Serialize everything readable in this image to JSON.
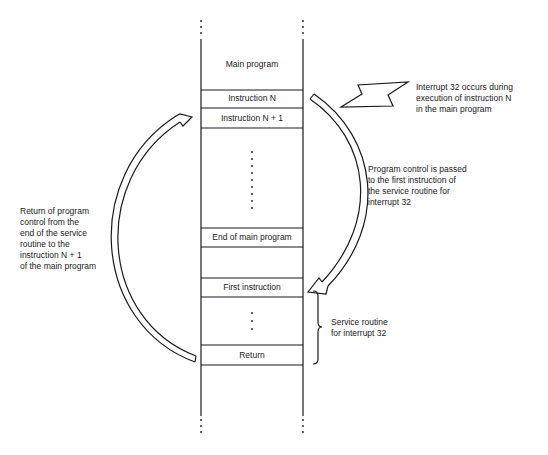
{
  "memory_column": {
    "cells": [
      {
        "id": "main-program",
        "label": "Main program"
      },
      {
        "id": "instruction-n",
        "label": "Instruction N"
      },
      {
        "id": "instruction-n-plus-1",
        "label": "Instruction N + 1"
      },
      {
        "id": "end-of-main-program",
        "label": "End of main program"
      },
      {
        "id": "first-instruction",
        "label": "First instruction"
      },
      {
        "id": "return",
        "label": "Return"
      }
    ]
  },
  "annotations": {
    "interrupt": "Interrupt 32 occurs during\nexecution of instruction N\nin the main program",
    "transfer": "Program control is passed\nto the first instruction of\nthe service routine for\ninterrupt 32",
    "service_routine": "Service routine\nfor interrupt 32",
    "return_path": "Return of program\ncontrol from the\nend of the service\nroutine to the\ninstruction N + 1\nof the main program"
  },
  "colors": {
    "line": "#1a1a1a",
    "background": "#ffffff"
  }
}
